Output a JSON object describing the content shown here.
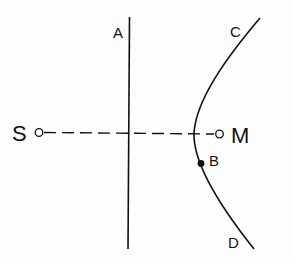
{
  "diagram": {
    "labels": {
      "S": "S",
      "M": "M",
      "A": "A",
      "B": "B",
      "C": "C",
      "D": "D"
    },
    "elements": {
      "source_point": "S",
      "mirror_point": "M",
      "straight_line": "A",
      "curve_top_end": "C",
      "curve_bottom_end": "D",
      "point_on_curve": "B"
    },
    "colors": {
      "stroke": "#111111",
      "background": "#fdfdfd",
      "open_circle_fill": "#ffffff",
      "filled_dot": "#111111"
    }
  }
}
